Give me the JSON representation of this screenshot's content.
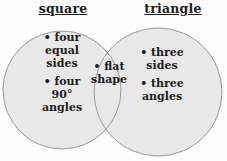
{
  "venn": {
    "left_label": "square",
    "right_label": "triangle",
    "left_items": [
      "• four\nequal\nsides",
      "• four\n90°\nangles"
    ],
    "intersection_items": [
      "• flat\nshape"
    ],
    "right_items": [
      "• three\nsides",
      "• three\nangles"
    ],
    "colors": {
      "background": "#fdfdfd",
      "circle_fill": "#e8e8e8",
      "circle_stroke": "#9a9a9a",
      "text": "#1c1c1c"
    }
  }
}
